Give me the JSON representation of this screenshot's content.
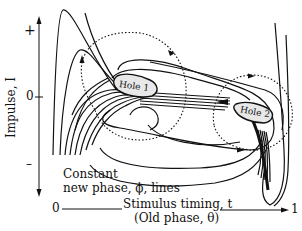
{
  "figure": {
    "y_axis": {
      "label": "Impulse, I",
      "ticks": [
        "+",
        "0",
        "–"
      ]
    },
    "x_axis": {
      "start_label": "0",
      "end_label": "1",
      "label_line1": "Stimulus timing, t",
      "label_line2": "(Old phase, θ)"
    },
    "annotation": {
      "line1": "Constant",
      "line2": "new phase, ϕ, lines"
    },
    "holes": [
      {
        "label": "Hole 1"
      },
      {
        "label": "Hole 2"
      }
    ]
  }
}
